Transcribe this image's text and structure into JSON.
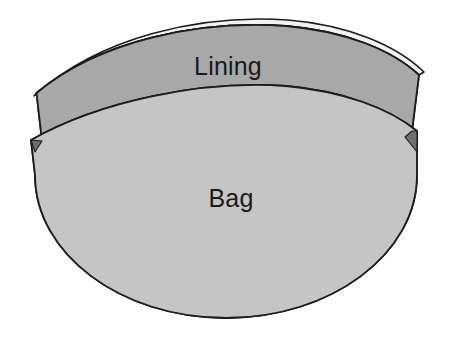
{
  "diagram": {
    "background_color": "#ffffff",
    "outline_color": "#1c1c1c",
    "parts": [
      {
        "id": "highlight",
        "name": "top-highlight-strip",
        "label": "",
        "fill_color": "#f2f2f2"
      },
      {
        "id": "lining",
        "name": "lining-band",
        "label": "Lining",
        "fill_color": "#a8a8a8",
        "label_x": 228,
        "label_y": 68
      },
      {
        "id": "bag",
        "name": "bag-body",
        "label": "Bag",
        "fill_color": "#c6c6c6",
        "label_x": 231,
        "label_y": 200
      }
    ],
    "labels": {
      "lining": "Lining",
      "bag": "Bag"
    }
  }
}
